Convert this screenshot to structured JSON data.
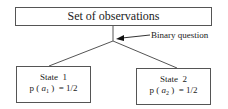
{
  "diagram": {
    "root": {
      "label": "Set of observations"
    },
    "annotation": {
      "label": "Binary question"
    },
    "states": [
      {
        "title": "State  1",
        "prob_prefix": "p ( ",
        "var": "a",
        "sub": "1",
        "prob_suffix": " )  = 1/2"
      },
      {
        "title": "State  2",
        "prob_prefix": "p ( ",
        "var": "a",
        "sub": "2",
        "prob_suffix": " )  = 1/2"
      }
    ],
    "colors": {
      "line": "#555555",
      "text": "#222222",
      "background": "#ffffff"
    }
  }
}
